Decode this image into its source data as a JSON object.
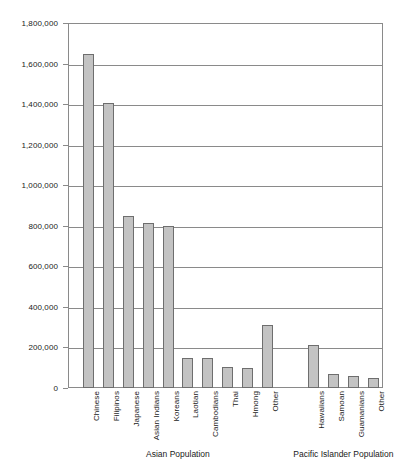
{
  "chart_data": {
    "type": "bar",
    "title": "",
    "xlabel": "",
    "ylabel": "",
    "ylim": [
      0,
      1800000
    ],
    "grid": true,
    "legend": "none",
    "y_ticks": [
      "0",
      "200,000",
      "400,000",
      "600,000",
      "800,000",
      "1,000,000",
      "1,200,000",
      "1,400,000",
      "1,600,000",
      "1,800,000"
    ],
    "y_tick_values": [
      0,
      200000,
      400000,
      600000,
      800000,
      1000000,
      1200000,
      1400000,
      1600000,
      1800000
    ],
    "categories": [
      "Chinese",
      "Filipinos",
      "Japanese",
      "Asian Indians",
      "Koreans",
      "Laotian",
      "Cambodians",
      "Thai",
      "Hmong",
      "Other",
      "Hawaiians",
      "Samoan",
      "Guamanians",
      "Other"
    ],
    "values": [
      1645000,
      1407000,
      848000,
      815000,
      799000,
      149000,
      147000,
      103000,
      100000,
      310000,
      213000,
      69000,
      58000,
      48000
    ],
    "groups": [
      {
        "label": "Asian Population",
        "start_index": 0,
        "end_index": 9
      },
      {
        "label": "Pacific Islander Population",
        "start_index": 10,
        "end_index": 13
      }
    ],
    "bar_color": "#c3c3c3",
    "bar_border_color": "#6e6e6e",
    "axis_color": "#8a8a8a",
    "background_color": "#ffffff"
  }
}
